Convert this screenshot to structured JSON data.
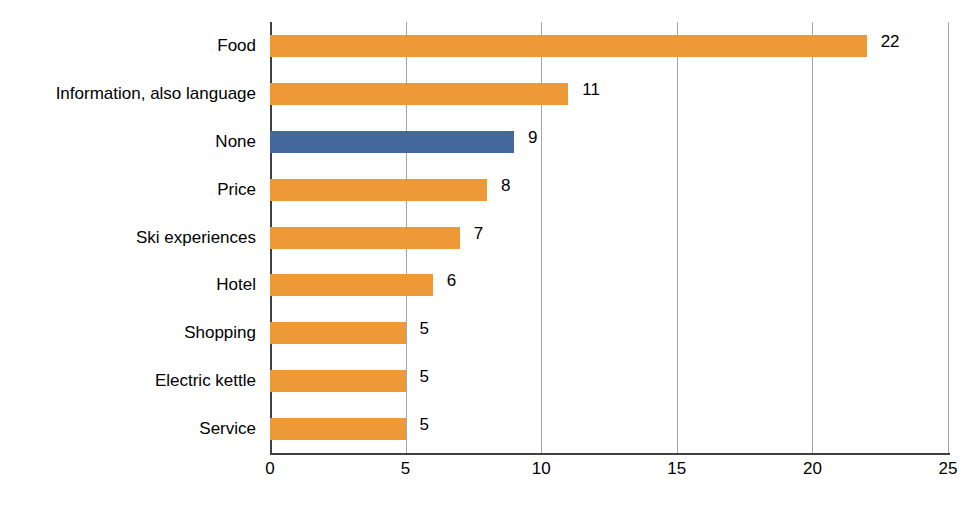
{
  "chart_data": {
    "type": "bar",
    "orientation": "horizontal",
    "title": "",
    "xlabel": "",
    "ylabel": "",
    "categories": [
      "Food",
      "Information, also language",
      "None",
      "Price",
      "Ski experiences",
      "Hotel",
      "Shopping",
      "Electric kettle",
      "Service"
    ],
    "values": [
      22,
      11,
      9,
      8,
      7,
      6,
      5,
      5,
      5
    ],
    "value_labels": [
      "22",
      "11",
      "9",
      "8",
      "7",
      "6",
      "5",
      "5",
      "5"
    ],
    "bar_colors": [
      "#ED9937",
      "#ED9937",
      "#44689E",
      "#ED9937",
      "#ED9937",
      "#ED9937",
      "#ED9937",
      "#ED9937",
      "#ED9937"
    ],
    "xlim": [
      0,
      25
    ],
    "xticks": [
      0,
      5,
      10,
      15,
      20,
      25
    ],
    "xtick_labels": [
      "0",
      "5",
      "10",
      "15",
      "20",
      "25"
    ],
    "grid": "vertical",
    "legend": "none",
    "accent_orange": "#ED9937",
    "accent_blue": "#44689E",
    "gridline_color": "#A6A6A6",
    "axis_color": "#404040"
  },
  "caption": ""
}
